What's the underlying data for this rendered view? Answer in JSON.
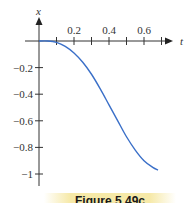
{
  "chart_data": {
    "type": "line",
    "title": "",
    "xlabel": "t",
    "ylabel": "x",
    "x_ticks": [
      0.1,
      0.2,
      0.3,
      0.4,
      0.5,
      0.6,
      0.7
    ],
    "x_tick_labels": [
      "0.2",
      "0.4",
      "0.6"
    ],
    "y_ticks": [
      -0.2,
      -0.4,
      -0.6,
      -0.8,
      -1
    ],
    "y_tick_labels": [
      "-0.2",
      "-0.4",
      "-0.6",
      "-0.8",
      "-1"
    ],
    "xlim": [
      0,
      0.75
    ],
    "ylim": [
      -1.1,
      0.1
    ],
    "grid": false,
    "legend": null,
    "series": [
      {
        "name": "x(t)",
        "color": "#3a6fc8",
        "x": [
          0,
          0.05,
          0.1,
          0.15,
          0.2,
          0.25,
          0.3,
          0.35,
          0.4,
          0.45,
          0.5,
          0.55,
          0.6,
          0.65,
          0.68
        ],
        "y": [
          0,
          0,
          -0.01,
          -0.04,
          -0.09,
          -0.16,
          -0.25,
          -0.36,
          -0.48,
          -0.6,
          -0.72,
          -0.82,
          -0.9,
          -0.95,
          -0.97
        ]
      }
    ]
  },
  "caption": "Figure 5.49c"
}
